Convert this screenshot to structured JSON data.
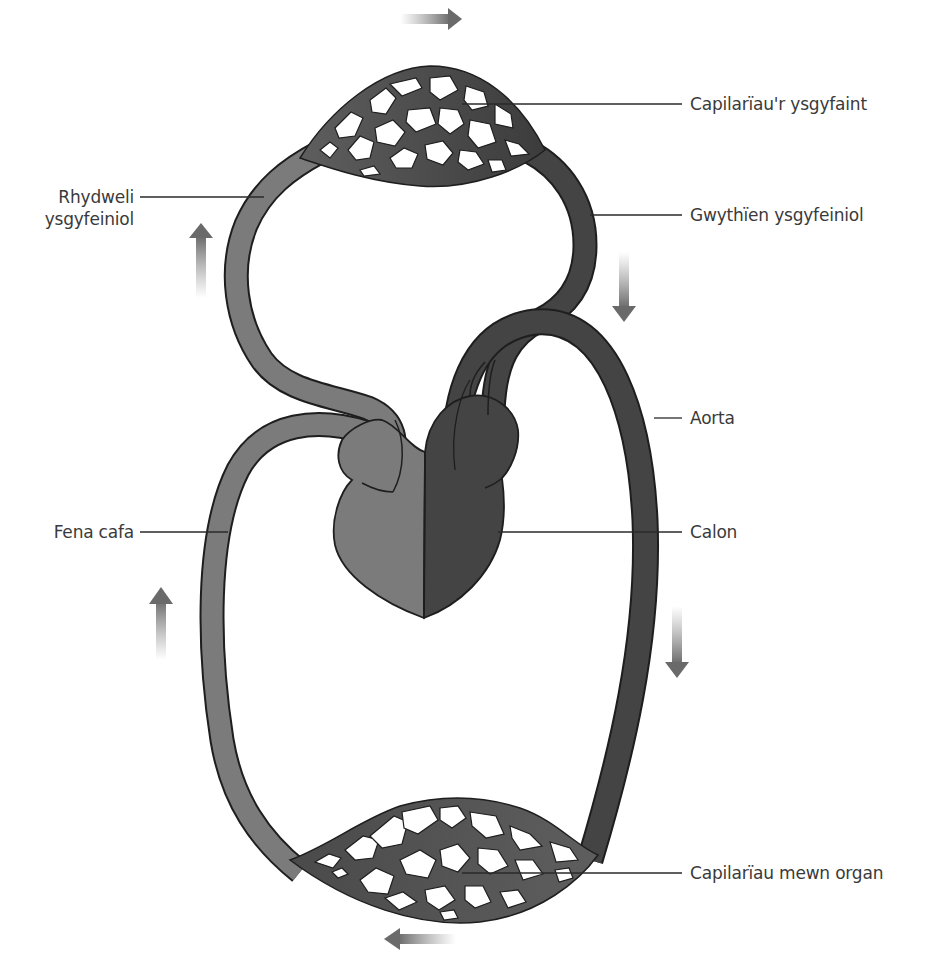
{
  "figure": {
    "colors": {
      "deoxygenated": "#7b7b7b",
      "oxygenated": "#444444",
      "outline": "#1e1e1e",
      "capillary_fill": "#3c3c3c",
      "leader_line": "#2a2a2a",
      "label_text": "#3a3a3a",
      "background": "#ffffff"
    },
    "labels": {
      "lung_capillaries": "Capilarïau'r ysgyfaint",
      "pulmonary_artery_line1": "Rhydweli",
      "pulmonary_artery_line2": "ysgyfeiniol",
      "pulmonary_vein": "Gwythïen ysgyfeiniol",
      "aorta": "Aorta",
      "vena_cava": "Fena cafa",
      "heart": "Calon",
      "organ_capillaries": "Capilarïau mewn organ"
    },
    "flow_arrows": [
      {
        "id": "top",
        "direction": "right"
      },
      {
        "id": "upper-left",
        "direction": "up"
      },
      {
        "id": "upper-right",
        "direction": "down"
      },
      {
        "id": "lower-left",
        "direction": "up"
      },
      {
        "id": "lower-right",
        "direction": "down"
      },
      {
        "id": "bottom",
        "direction": "left"
      }
    ]
  }
}
